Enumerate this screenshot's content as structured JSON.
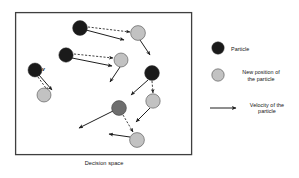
{
  "figure": {
    "caption": "Decision space",
    "v_annotation": "v",
    "canvas": {
      "width": 299,
      "height": 178,
      "background": "#ffffff"
    },
    "decision_space_box": {
      "x": 15,
      "y": 12,
      "width": 177,
      "height": 143,
      "stroke": "#3f3f3f",
      "stroke_width": 1.2,
      "fill": "#ffffff"
    },
    "colors": {
      "particle": "#1a1a1a",
      "particle_mid": "#6e6e6e",
      "new_position": "#c2c2c2",
      "outline": "#333333",
      "arrow": "#1f1f1f",
      "box_border": "#3f3f3f",
      "text": "#131313"
    }
  },
  "legend": {
    "items": [
      {
        "key": "particle",
        "label": "Particle",
        "marker": "filled-dark-circle",
        "color": "#1a1a1a",
        "cx": 218,
        "cy": 48,
        "r": 6.2
      },
      {
        "key": "new_position",
        "label": "New position of\nthe particle",
        "marker": "filled-light-circle",
        "color": "#c2c2c2",
        "cx": 218,
        "cy": 75,
        "r": 6.2
      },
      {
        "key": "velocity",
        "label": "Velocity of the\nparticle",
        "marker": "arrow",
        "color": "#1f1f1f",
        "x1": 210,
        "y1": 108,
        "x2": 237,
        "y2": 108
      }
    ]
  },
  "diagram": {
    "particles": [
      {
        "id": "p1",
        "type": "particle",
        "cx": 35,
        "cy": 70,
        "r": 7.0,
        "color": "#1a1a1a"
      },
      {
        "id": "p1n",
        "type": "new_position",
        "cx": 44,
        "cy": 95,
        "r": 7.0,
        "color": "#c2c2c2"
      },
      {
        "id": "p2",
        "type": "particle",
        "cx": 80,
        "cy": 28,
        "r": 7.4,
        "color": "#1a1a1a"
      },
      {
        "id": "p2n",
        "type": "new_position",
        "cx": 138,
        "cy": 33,
        "r": 7.4,
        "color": "#c2c2c2"
      },
      {
        "id": "p3",
        "type": "particle",
        "cx": 66,
        "cy": 55,
        "r": 7.2,
        "color": "#1a1a1a"
      },
      {
        "id": "p3n",
        "type": "new_position",
        "cx": 121,
        "cy": 60,
        "r": 7.0,
        "color": "#c2c2c2"
      },
      {
        "id": "p4",
        "type": "particle",
        "cx": 152,
        "cy": 73,
        "r": 7.4,
        "color": "#1a1a1a"
      },
      {
        "id": "p4n",
        "type": "new_position",
        "cx": 153,
        "cy": 101,
        "r": 7.2,
        "color": "#c2c2c2"
      },
      {
        "id": "p5",
        "type": "particle_mid",
        "cx": 119,
        "cy": 108,
        "r": 7.4,
        "color": "#6e6e6e"
      },
      {
        "id": "p5n",
        "type": "new_position",
        "cx": 137,
        "cy": 140,
        "r": 7.4,
        "color": "#c2c2c2"
      }
    ],
    "displacement_arrows": [
      {
        "from": "p1",
        "to": "p1n",
        "x1": 38,
        "y1": 77,
        "x2": 48,
        "y2": 91,
        "style": "dashed"
      },
      {
        "from": "p2",
        "to": "p2n",
        "x1": 88,
        "y1": 27,
        "x2": 130,
        "y2": 32,
        "style": "dashed"
      },
      {
        "from": "p3",
        "to": "p3n",
        "x1": 74,
        "y1": 54,
        "x2": 113,
        "y2": 58,
        "style": "dashed"
      },
      {
        "from": "p4",
        "to": "p4n",
        "x1": 152,
        "y1": 81,
        "x2": 153,
        "y2": 93,
        "style": "dashed"
      },
      {
        "from": "p5",
        "to": "p5n",
        "x1": 123,
        "y1": 115,
        "x2": 133,
        "y2": 132,
        "style": "dashed"
      }
    ],
    "velocity_arrows": [
      {
        "from": "p1",
        "x1": 39,
        "y1": 75,
        "x2": 52,
        "y2": 91,
        "style": "solid"
      },
      {
        "from": "p2",
        "x1": 86,
        "y1": 30,
        "x2": 125,
        "y2": 40,
        "style": "solid"
      },
      {
        "from": "p2n",
        "x1": 140,
        "y1": 40,
        "x2": 150,
        "y2": 55,
        "style": "solid"
      },
      {
        "from": "p3",
        "x1": 72,
        "y1": 58,
        "x2": 113,
        "y2": 66,
        "style": "solid"
      },
      {
        "from": "p3n",
        "x1": 120,
        "y1": 67,
        "x2": 110,
        "y2": 82,
        "style": "solid"
      },
      {
        "from": "p4",
        "x1": 148,
        "y1": 80,
        "x2": 131,
        "y2": 95,
        "style": "solid"
      },
      {
        "from": "p4n",
        "x1": 150,
        "y1": 108,
        "x2": 136,
        "y2": 122,
        "style": "solid"
      },
      {
        "from": "p5",
        "x1": 113,
        "y1": 111,
        "x2": 78,
        "y2": 128,
        "style": "solid"
      },
      {
        "from": "p5n",
        "x1": 130,
        "y1": 137,
        "x2": 108,
        "y2": 134,
        "style": "solid"
      }
    ]
  }
}
